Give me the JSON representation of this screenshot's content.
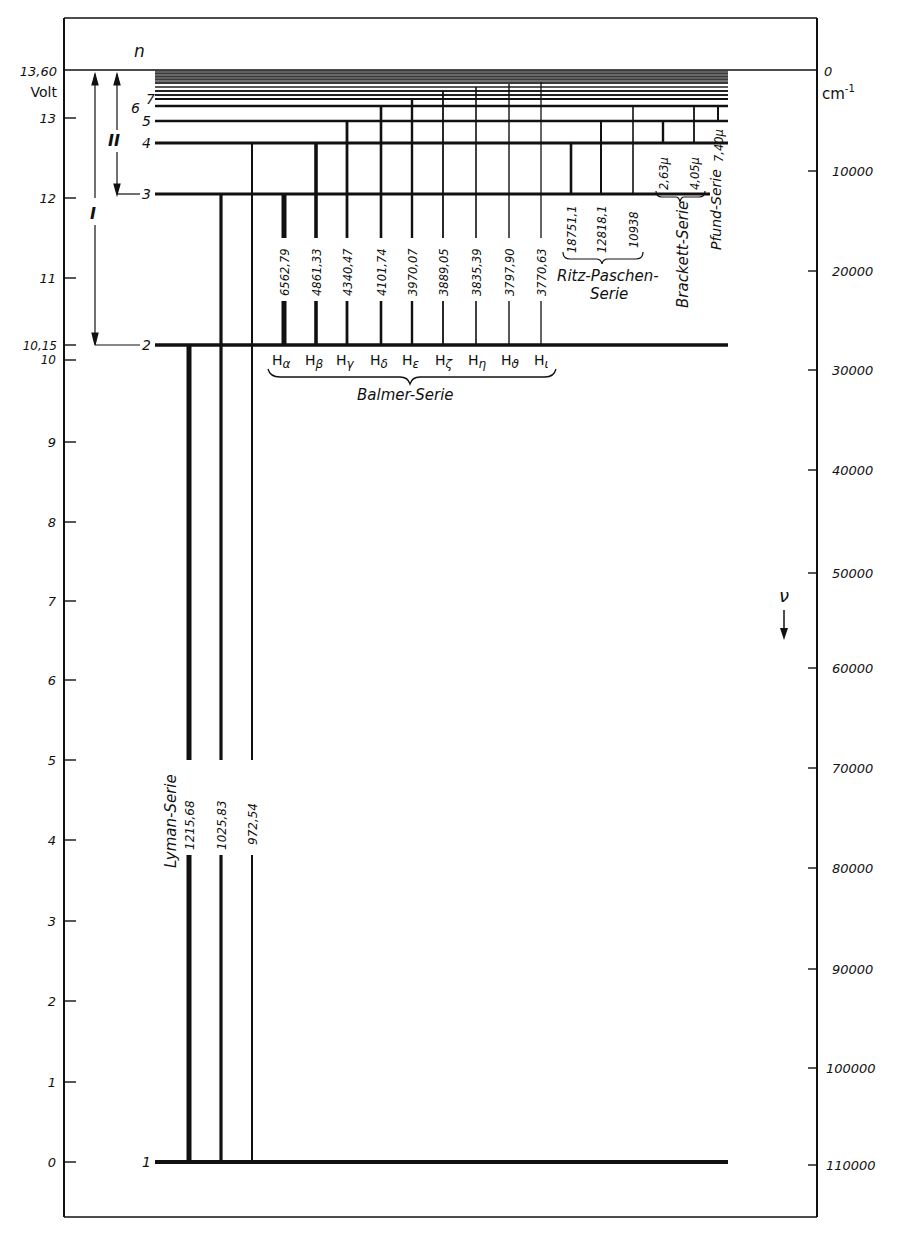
{
  "diagram": {
    "left_axis": {
      "unit_label": "Volt",
      "top_value_label": "13,60",
      "ticks": [
        {
          "label": "13",
          "value": 13
        },
        {
          "label": "12",
          "value": 12
        },
        {
          "label": "11",
          "value": 11
        },
        {
          "label": "10,15",
          "value": 10.15
        },
        {
          "label": "10",
          "value": 10
        },
        {
          "label": "9",
          "value": 9
        },
        {
          "label": "8",
          "value": 8
        },
        {
          "label": "7",
          "value": 7
        },
        {
          "label": "6",
          "value": 6
        },
        {
          "label": "5",
          "value": 5
        },
        {
          "label": "4",
          "value": 4
        },
        {
          "label": "3",
          "value": 3
        },
        {
          "label": "2",
          "value": 2
        },
        {
          "label": "1",
          "value": 1
        },
        {
          "label": "0",
          "value": 0
        }
      ]
    },
    "right_axis": {
      "unit_label": "cm",
      "unit_exponent": "-1",
      "symbol": "ν",
      "ticks": [
        {
          "label": "0",
          "value": 0
        },
        {
          "label": "10000",
          "value": 10000
        },
        {
          "label": "20000",
          "value": 20000
        },
        {
          "label": "30000",
          "value": 30000
        },
        {
          "label": "40000",
          "value": 40000
        },
        {
          "label": "50000",
          "value": 50000
        },
        {
          "label": "60000",
          "value": 60000
        },
        {
          "label": "70000",
          "value": 70000
        },
        {
          "label": "80000",
          "value": 80000
        },
        {
          "label": "90000",
          "value": 90000
        },
        {
          "label": "100000",
          "value": 100000
        },
        {
          "label": "110000",
          "value": 110000
        }
      ]
    },
    "level_header": "n",
    "levels": [
      {
        "n": "1",
        "energy_V": 0
      },
      {
        "n": "2",
        "energy_V": 10.2
      },
      {
        "n": "3",
        "energy_V": 12.09
      },
      {
        "n": "4",
        "energy_V": 12.75
      },
      {
        "n": "5",
        "energy_V": 13.06
      },
      {
        "n": "6",
        "energy_V": 13.22
      },
      {
        "n": "7",
        "energy_V": 13.32
      }
    ],
    "ionization_markers": [
      {
        "label": "I",
        "from": "13,60",
        "to": "n=2"
      },
      {
        "label": "II",
        "from": "13,60",
        "to": "n=3"
      }
    ],
    "series": {
      "lyman": {
        "name": "Lyman-Serie",
        "lines": [
          {
            "wavelength": "1215,68"
          },
          {
            "wavelength": "1025,83"
          },
          {
            "wavelength": "972,54"
          }
        ]
      },
      "balmer": {
        "name": "Balmer-Serie",
        "lines": [
          {
            "wavelength": "6562,79",
            "symbol": "H",
            "sub": "α"
          },
          {
            "wavelength": "4861,33",
            "symbol": "H",
            "sub": "β"
          },
          {
            "wavelength": "4340,47",
            "symbol": "H",
            "sub": "γ"
          },
          {
            "wavelength": "4101,74",
            "symbol": "H",
            "sub": "δ"
          },
          {
            "wavelength": "3970,07",
            "symbol": "H",
            "sub": "ε"
          },
          {
            "wavelength": "3889,05",
            "symbol": "H",
            "sub": "ζ"
          },
          {
            "wavelength": "3835,39",
            "symbol": "H",
            "sub": "η"
          },
          {
            "wavelength": "3797,90",
            "symbol": "H",
            "sub": "ϑ"
          },
          {
            "wavelength": "3770,63",
            "symbol": "H",
            "sub": "ι"
          }
        ]
      },
      "paschen": {
        "name_line1": "Ritz-Paschen-",
        "name_line2": "Serie",
        "lines": [
          {
            "wavelength": "18751,1"
          },
          {
            "wavelength": "12818,1"
          },
          {
            "wavelength": "10938"
          }
        ]
      },
      "brackett": {
        "name": "Brackett-Serie",
        "lines": [
          {
            "wavelength": "2,63μ"
          },
          {
            "wavelength": "4,05μ"
          }
        ]
      },
      "pfund": {
        "name": "Pfund-Serie",
        "lines": [
          {
            "wavelength": "7,40μ"
          }
        ]
      }
    }
  }
}
